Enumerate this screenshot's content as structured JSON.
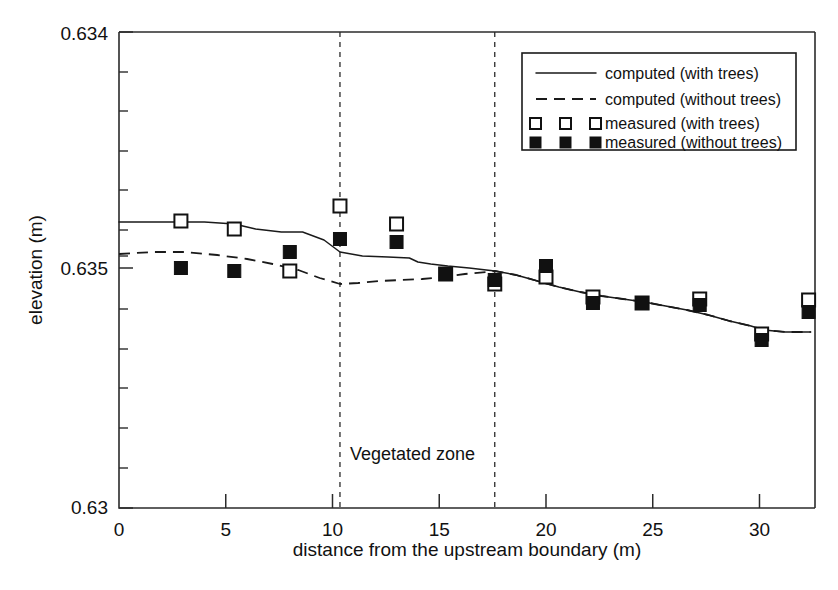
{
  "chart_data": {
    "type": "scatter",
    "title": "",
    "xlabel": "distance from the upstream boundary (m)",
    "ylabel": "elevation (m)",
    "xlim": [
      0,
      32.6
    ],
    "ylim_labels": [
      "0.63",
      "0.635",
      "0.634"
    ],
    "xticks": [
      0,
      5,
      10,
      15,
      20,
      25,
      30
    ],
    "xticklabels": [
      "0",
      "5",
      "10",
      "15",
      "20",
      "25",
      "30"
    ],
    "yticklabels": [
      {
        "value": "0.634",
        "position": "top"
      },
      {
        "value": "0.635",
        "position": "middle"
      },
      {
        "value": "0.63",
        "position": "bottom"
      }
    ],
    "grid": false,
    "legend_position": "upper right",
    "annotations": [
      {
        "text": "Vegetated zone",
        "x": 11.2,
        "y_frac": 0.8
      }
    ],
    "vertical_lines": [
      {
        "x": 10.35,
        "style": "dashed",
        "label": "vegetated zone start"
      },
      {
        "x": 17.6,
        "style": "dashed",
        "label": "vegetated zone end"
      }
    ],
    "series": [
      {
        "name": "computed (with trees)",
        "type": "line",
        "style": "solid",
        "x": [
          0,
          2.0,
          4.0,
          5.4,
          6.4,
          7.6,
          8.6,
          9.6,
          10.35,
          11.4,
          12.6,
          13.6,
          14.0,
          14.6,
          15.4,
          16.4,
          17.6,
          18.6,
          19.6,
          20.6,
          21.6,
          22.6,
          23.6,
          24.6,
          25.6,
          26.6,
          27.6,
          28.6,
          29.6,
          30.2,
          31.2,
          32.4
        ],
        "y_px": [
          222,
          222,
          222,
          224,
          229,
          232,
          232,
          240,
          252,
          256,
          257,
          258,
          262,
          264,
          266,
          268,
          271,
          275,
          281,
          287,
          292,
          296,
          299,
          302,
          306,
          310,
          315,
          321,
          326,
          330,
          332,
          332
        ]
      },
      {
        "name": "computed (without trees)",
        "type": "line",
        "style": "dashed",
        "x": [
          0,
          1.6,
          3.0,
          4.6,
          6.0,
          7.2,
          8.4,
          9.4,
          10.35,
          11.2,
          12.2,
          13.2,
          14.2,
          15.2,
          16.2,
          17.2,
          17.6,
          18.6,
          19.6,
          20.6,
          21.6,
          22.6,
          23.6,
          24.6,
          25.6,
          26.6,
          27.6,
          28.6,
          29.6,
          30.2,
          31.2,
          32.4
        ],
        "y_px": [
          254,
          252,
          252,
          255,
          259,
          264,
          270,
          278,
          284,
          283,
          281,
          280,
          279,
          277,
          274,
          272,
          271,
          275,
          281,
          287,
          292,
          296,
          299,
          302,
          306,
          310,
          315,
          321,
          326,
          330,
          332,
          332
        ]
      },
      {
        "name": "measured (with trees)",
        "type": "scatter",
        "marker": "open-square",
        "points": [
          {
            "x": 2.9,
            "y_px": 221
          },
          {
            "x": 5.4,
            "y_px": 229
          },
          {
            "x": 8.0,
            "y_px": 271
          },
          {
            "x": 10.35,
            "y_px": 206
          },
          {
            "x": 13.0,
            "y_px": 224
          },
          {
            "x": 15.3,
            "y_px": 274
          },
          {
            "x": 17.6,
            "y_px": 284
          },
          {
            "x": 20.0,
            "y_px": 277
          },
          {
            "x": 22.2,
            "y_px": 297
          },
          {
            "x": 24.5,
            "y_px": 303
          },
          {
            "x": 27.2,
            "y_px": 299
          },
          {
            "x": 30.1,
            "y_px": 334
          },
          {
            "x": 32.3,
            "y_px": 300
          }
        ]
      },
      {
        "name": "measured (without trees)",
        "type": "scatter",
        "marker": "filled-square",
        "points": [
          {
            "x": 2.9,
            "y_px": 268
          },
          {
            "x": 5.4,
            "y_px": 271
          },
          {
            "x": 8.0,
            "y_px": 252
          },
          {
            "x": 10.35,
            "y_px": 239
          },
          {
            "x": 13.0,
            "y_px": 242
          },
          {
            "x": 15.3,
            "y_px": 274
          },
          {
            "x": 17.6,
            "y_px": 280
          },
          {
            "x": 20.0,
            "y_px": 266
          },
          {
            "x": 22.2,
            "y_px": 303
          },
          {
            "x": 24.5,
            "y_px": 303
          },
          {
            "x": 27.2,
            "y_px": 305
          },
          {
            "x": 30.1,
            "y_px": 340
          },
          {
            "x": 32.3,
            "y_px": 312
          }
        ]
      }
    ]
  },
  "axes": {
    "x_label": "distance from the upstream boundary (m)",
    "y_label": "elevation (m)",
    "x_tick_labels": [
      "0",
      "5",
      "10",
      "15",
      "20",
      "25",
      "30"
    ],
    "y_tick_label_top": "0.634",
    "y_tick_label_mid": "0.635",
    "y_tick_label_bottom": "0.63"
  },
  "annotation": {
    "vegetated_zone": "Vegetated zone"
  },
  "legend": {
    "items": [
      {
        "label": "computed (with trees)",
        "glyph": "solid-line"
      },
      {
        "label": "computed (without trees)",
        "glyph": "dashed-line"
      },
      {
        "label": "measured (with trees)",
        "glyph": "open-square-triple"
      },
      {
        "label": "measured (without trees)",
        "glyph": "filled-square-triple"
      }
    ]
  },
  "colors": {
    "ink": "#111111",
    "axis": "#2b2b2b",
    "background": "#ffffff"
  }
}
